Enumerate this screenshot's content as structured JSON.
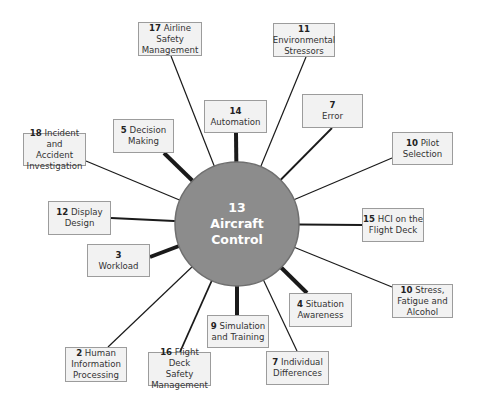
{
  "diagram": {
    "type": "hub-and-spoke",
    "center": {
      "num": "13",
      "label": "Aircraft\nControl",
      "fill": "#8c8c8c",
      "stroke": "#6f6f6f"
    },
    "box_fill": "#f2f2f2",
    "box_border": "#9c9c9c",
    "line_color": "#1a1a1a",
    "nodes": [
      {
        "id": "n17",
        "num": "17",
        "label": " Airline\nSafety\nManagement",
        "x": 138,
        "y": 22,
        "w": 64,
        "h": 34,
        "ax": 171,
        "ay": 56,
        "weight": 1.2
      },
      {
        "id": "n11",
        "num": "11",
        "label": "\nEnvironmental\nStressors",
        "x": 273,
        "y": 23,
        "w": 62,
        "h": 34,
        "ax": 306,
        "ay": 57,
        "weight": 1.2
      },
      {
        "id": "n14",
        "num": "14",
        "label": "\nAutomation",
        "x": 204,
        "y": 100,
        "w": 63,
        "h": 33,
        "ax": 236,
        "ay": 133,
        "weight": 4
      },
      {
        "id": "n7a",
        "num": "7",
        "label": "\nError",
        "x": 302,
        "y": 94,
        "w": 61,
        "h": 34,
        "ax": 332,
        "ay": 128,
        "weight": 1.8
      },
      {
        "id": "n5",
        "num": "5",
        "label": " Decision\nMaking",
        "x": 113,
        "y": 119,
        "w": 61,
        "h": 34,
        "ax": 164,
        "ay": 153,
        "weight": 4
      },
      {
        "id": "n18",
        "num": "18",
        "label": " Incident and\nAccident\nInvestigation",
        "x": 23,
        "y": 133,
        "w": 63,
        "h": 33,
        "ax": 86,
        "ay": 161,
        "weight": 1.2
      },
      {
        "id": "n10a",
        "num": "10",
        "label": " Pilot\nSelection",
        "x": 392,
        "y": 132,
        "w": 61,
        "h": 33,
        "ax": 392,
        "ay": 158,
        "weight": 1.2
      },
      {
        "id": "n12",
        "num": "12",
        "label": " Display\nDesign",
        "x": 48,
        "y": 201,
        "w": 63,
        "h": 34,
        "ax": 111,
        "ay": 218,
        "weight": 2
      },
      {
        "id": "n15",
        "num": "15",
        "label": " HCI on the\nFlight Deck",
        "x": 362,
        "y": 208,
        "w": 62,
        "h": 34,
        "ax": 362,
        "ay": 225,
        "weight": 2
      },
      {
        "id": "n3",
        "num": "3",
        "label": "\nWorkload",
        "x": 87,
        "y": 244,
        "w": 63,
        "h": 33,
        "ax": 150,
        "ay": 257,
        "weight": 4
      },
      {
        "id": "n10b",
        "num": "10",
        "label": " Stress,\nFatigue and\nAlcohol",
        "x": 392,
        "y": 284,
        "w": 61,
        "h": 34,
        "ax": 392,
        "ay": 287,
        "weight": 1.2
      },
      {
        "id": "n4",
        "num": "4",
        "label": " Situation\nAwareness",
        "x": 289,
        "y": 293,
        "w": 63,
        "h": 34,
        "ax": 307,
        "ay": 293,
        "weight": 4
      },
      {
        "id": "n9",
        "num": "9",
        "label": " Simulation\nand Training",
        "x": 207,
        "y": 315,
        "w": 62,
        "h": 33,
        "ax": 237,
        "ay": 315,
        "weight": 4
      },
      {
        "id": "n2",
        "num": "2",
        "label": " Human\nInformation\nProcessing",
        "x": 65,
        "y": 347,
        "w": 62,
        "h": 35,
        "ax": 108,
        "ay": 347,
        "weight": 1.2
      },
      {
        "id": "n16",
        "num": "16",
        "label": " Flight Deck\nSafety\nManagement",
        "x": 148,
        "y": 352,
        "w": 63,
        "h": 34,
        "ax": 180,
        "ay": 352,
        "weight": 1.8
      },
      {
        "id": "n7b",
        "num": "7",
        "label": " Individual\nDifferences",
        "x": 266,
        "y": 351,
        "w": 63,
        "h": 34,
        "ax": 297,
        "ay": 351,
        "weight": 1.2
      }
    ]
  }
}
